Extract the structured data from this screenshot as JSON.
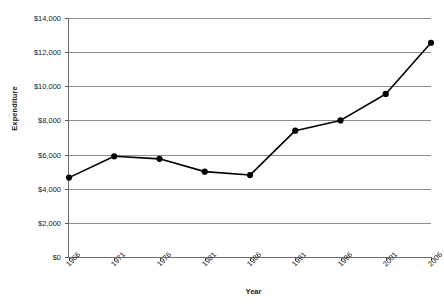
{
  "chart_data": {
    "type": "line",
    "title": "",
    "xlabel": "Year",
    "ylabel": "Expenditure",
    "x": [
      1966,
      1971,
      1976,
      1981,
      1986,
      1991,
      1996,
      2001,
      2006
    ],
    "categories": [
      "1966",
      "1971",
      "1976",
      "1981",
      "1986",
      "1991",
      "1996",
      "2001",
      "2006"
    ],
    "values": [
      4650,
      5900,
      5750,
      5000,
      4800,
      7400,
      8000,
      9550,
      12550
    ],
    "series": [
      {
        "name": "Expenditure",
        "values": [
          4650,
          5900,
          5750,
          5000,
          4800,
          7400,
          8000,
          9550,
          12550
        ]
      }
    ],
    "ylim": [
      0,
      14000
    ],
    "xlim": [
      1966,
      2006
    ],
    "ytick_values": [
      0,
      2000,
      4000,
      6000,
      8000,
      10000,
      12000,
      14000
    ],
    "ytick_labels": [
      "$0",
      "$2,000",
      "$4,000",
      "$6,000",
      "$8,000",
      "$10,000",
      "$12,000",
      "$14,000"
    ],
    "xtick_labels": [
      "1966",
      "1971",
      "1976",
      "1981",
      "1986",
      "1991",
      "1996",
      "2001",
      "2006"
    ],
    "grid": "horizontal",
    "legend": "none",
    "marker": "filled-circle",
    "line_color": "#000000",
    "marker_color": "#000000",
    "grid_color": "#8d8d8d",
    "axis_color": "#6f6f6f",
    "background_color": "#ffffff"
  }
}
